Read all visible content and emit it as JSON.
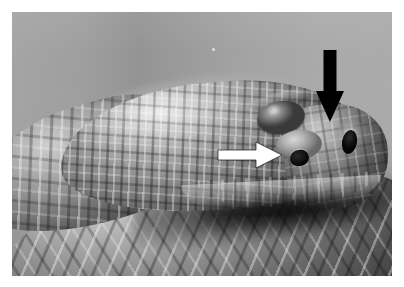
{
  "page": {
    "background_color": "#ffffff",
    "width": 404,
    "height": 287
  },
  "figure": {
    "type": "photograph",
    "color_mode": "grayscale",
    "frame": {
      "x": 12,
      "y": 12,
      "width": 380,
      "height": 264
    },
    "background_description": "plain studio gray backdrop with soft vertical gradient",
    "caption": ""
  },
  "annotations": {
    "black_arrow": {
      "name": "black-down-arrow",
      "color": "#000000",
      "direction": "down",
      "points_at": "nostril",
      "x": 310,
      "y": 50,
      "width": 40,
      "height": 72
    },
    "white_arrow": {
      "name": "white-right-arrow",
      "color": "#ffffff",
      "outline_color": "#111111",
      "direction": "right",
      "points_at": "loreal pit (heat-sensing pit)",
      "x": 218,
      "y": 140,
      "width": 64,
      "height": 28
    }
  },
  "anatomy": {
    "eye": {
      "label": "eye",
      "x": 245,
      "y": 89
    },
    "nostril": {
      "label": "nostril",
      "x": 330,
      "y": 118
    },
    "loreal_pit": {
      "label": "loreal pit",
      "x": 278,
      "y": 138
    },
    "head_scales": {
      "label": "keeled head scales"
    },
    "body_scales": {
      "label": "keeled dorsal body scales"
    },
    "supralabials": {
      "label": "supralabial scales"
    }
  },
  "artifacts": {
    "dust_speck": {
      "label": "dust speck",
      "x": 200,
      "y": 36
    }
  }
}
